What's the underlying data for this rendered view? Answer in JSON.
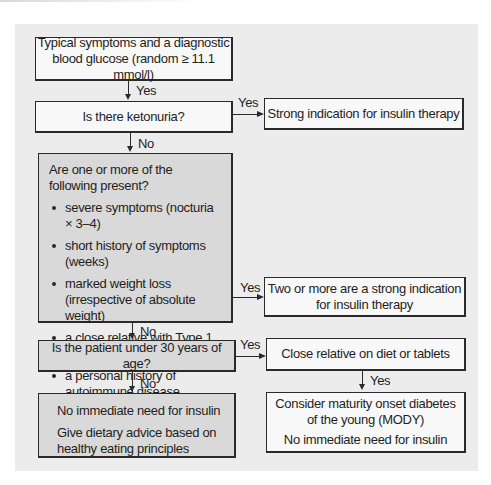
{
  "flowchart": {
    "start": {
      "text_line1": "Typical symptoms and a diagnostic",
      "text_line2": "blood glucose (random ≥ 11.1 mmol/l)"
    },
    "ketonuria": {
      "question": "Is there ketonuria?",
      "yes_label": "Yes",
      "no_label": "No",
      "yes_outcome": "Strong indication for insulin therapy"
    },
    "criteria": {
      "intro": "Are one or more of the following present?",
      "items": [
        "severe symptoms (nocturia × 3–4)",
        "short history of symptoms (weeks)",
        "marked weight loss (irrespective of absolute weight)",
        "a close relative with Type 1 diabetes",
        "a personal history of autoimmune disease"
      ],
      "yes_label": "Yes",
      "no_label": "No",
      "yes_outcome_line1": "Two or more are a strong indication",
      "yes_outcome_line2": "for insulin therapy"
    },
    "age": {
      "question": "Is the patient under 30 years of age?",
      "yes_label": "Yes",
      "no_label": "No",
      "yes_step": "Close relative on diet or tablets",
      "yes_step_yes_label": "Yes",
      "mody_line1": "Consider maturity onset diabetes",
      "mody_line2": "of the young (MODY)",
      "mody_line3": "No immediate need for insulin",
      "no_outcome_line1": "No immediate need for insulin",
      "no_outcome_line2": "Give dietary advice based on healthy eating principles"
    },
    "start_yes_label": "Yes"
  },
  "colors": {
    "panel_bg": "#ececec",
    "white_box": "#f8f8f8",
    "gray_box": "#d9d9d9",
    "line": "#2a2a2a"
  }
}
